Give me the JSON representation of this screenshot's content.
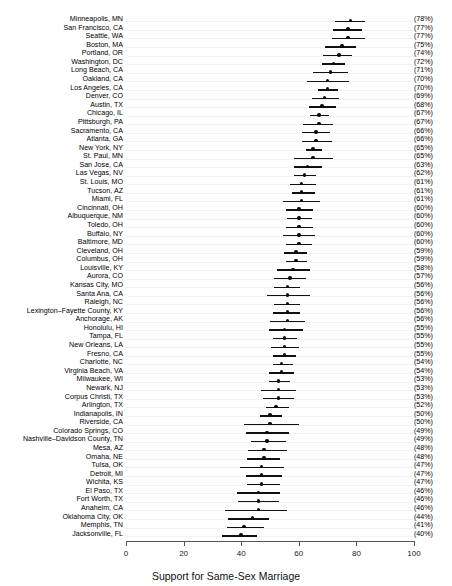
{
  "chart_data": {
    "type": "scatter",
    "title": "",
    "subtitle": "",
    "xlabel": "Support for Same-Sex Marriage",
    "ylabel": "",
    "xlim": [
      0,
      100
    ],
    "xticks": [
      0,
      20,
      40,
      60,
      80,
      100
    ],
    "xtick_labels": [
      "0",
      "20",
      "40",
      "60",
      "80",
      "100"
    ],
    "grid": true,
    "grid_orientation": "horizontal",
    "legend": null,
    "annotation_note": "Point estimate with horizontal 95% credible interval; value label in parentheses at right.",
    "point_marker": "filled-circle",
    "error_bar_style": "horizontal-line",
    "categories": [
      "Minneapolis, MN",
      "San Francisco, CA",
      "Seattle, WA",
      "Boston, MA",
      "Portland, OR",
      "Washington, DC",
      "Long Beach, CA",
      "Oakland, CA",
      "Los Angeles, CA",
      "Denver, CO",
      "Austin, TX",
      "Chicago, IL",
      "Pittsburgh, PA",
      "Sacramento, CA",
      "Atlanta, GA",
      "New York, NY",
      "St. Paul, MN",
      "San Jose, CA",
      "Las Vegas, NV",
      "St. Louis, MO",
      "Tucson, AZ",
      "Miami, FL",
      "Cincinnati, OH",
      "Albuquerque, NM",
      "Toledo, OH",
      "Buffalo, NY",
      "Baltimore, MD",
      "Cleveland, OH",
      "Columbus, OH",
      "Louisville, KY",
      "Aurora, CO",
      "Kansas City, MO",
      "Santa Ana, CA",
      "Raleigh, NC",
      "Lexington–Fayette County, KY",
      "Anchorage, AK",
      "Honolulu, HI",
      "Tampa, FL",
      "New Orleans, LA",
      "Fresno, CA",
      "Charlotte, NC",
      "Virginia Beach, VA",
      "Milwaukee, WI",
      "Newark, NJ",
      "Corpus Christi, TX",
      "Arlington, TX",
      "Indianapolis, IN",
      "Riverside, CA",
      "Colorado Springs, CO",
      "Nashville–Davidson County, TN",
      "Mesa, AZ",
      "Omaha, NE",
      "Tulsa, OK",
      "Detroit, MI",
      "Wichita, KS",
      "El Paso, TX",
      "Fort Worth, TX",
      "Anaheim, CA",
      "Oklahoma City, OK",
      "Memphis, TN",
      "Jacksonville, FL"
    ],
    "values": [
      78,
      77,
      77,
      75,
      74,
      72,
      71,
      70,
      70,
      69,
      68,
      67,
      67,
      66,
      66,
      65,
      65,
      63,
      62,
      61,
      61,
      61,
      60,
      60,
      60,
      60,
      60,
      59,
      59,
      58,
      57,
      56,
      56,
      56,
      56,
      56,
      55,
      55,
      55,
      55,
      54,
      54,
      53,
      53,
      53,
      52,
      50,
      50,
      49,
      49,
      48,
      48,
      47,
      47,
      47,
      46,
      46,
      46,
      44,
      41,
      40
    ],
    "value_labels": [
      "(78%)",
      "(77%)",
      "(77%)",
      "(75%)",
      "(74%)",
      "(72%)",
      "(71%)",
      "(70%)",
      "(70%)",
      "(69%)",
      "(68%)",
      "(67%)",
      "(67%)",
      "(66%)",
      "(66%)",
      "(65%)",
      "(65%)",
      "(63%)",
      "(62%)",
      "(61%)",
      "(61%)",
      "(61%)",
      "(60%)",
      "(60%)",
      "(60%)",
      "(60%)",
      "(60%)",
      "(59%)",
      "(59%)",
      "(58%)",
      "(57%)",
      "(56%)",
      "(56%)",
      "(56%)",
      "(56%)",
      "(56%)",
      "(55%)",
      "(55%)",
      "(55%)",
      "(55%)",
      "(54%)",
      "(54%)",
      "(53%)",
      "(53%)",
      "(53%)",
      "(52%)",
      "(50%)",
      "(50%)",
      "(49%)",
      "(49%)",
      "(48%)",
      "(48%)",
      "(47%)",
      "(47%)",
      "(47%)",
      "(46%)",
      "(46%)",
      "(46%)",
      "(44%)",
      "(41%)",
      "(40%)"
    ],
    "ci_low": [
      72.5,
      72.0,
      71.5,
      69.0,
      68.5,
      68.0,
      65.0,
      63.0,
      66.5,
      64.5,
      63.5,
      64.0,
      61.5,
      61.0,
      61.0,
      62.5,
      58.5,
      58.5,
      58.5,
      57.0,
      57.5,
      54.5,
      55.5,
      56.0,
      55.5,
      54.5,
      55.5,
      55.0,
      55.5,
      52.5,
      51.5,
      51.5,
      49.0,
      51.5,
      51.0,
      50.0,
      49.5,
      51.0,
      50.5,
      51.0,
      51.0,
      49.5,
      49.5,
      47.0,
      47.5,
      48.5,
      46.5,
      41.0,
      41.5,
      43.5,
      42.5,
      42.0,
      39.5,
      41.5,
      42.0,
      38.5,
      39.0,
      34.5,
      35.5,
      35.0,
      33.5
    ],
    "ci_high": [
      83.0,
      82.0,
      83.0,
      80.0,
      78.5,
      76.0,
      77.0,
      77.5,
      73.5,
      74.0,
      73.0,
      70.5,
      72.0,
      71.0,
      71.5,
      68.0,
      72.0,
      68.0,
      66.0,
      66.0,
      65.5,
      67.5,
      65.0,
      64.5,
      65.0,
      65.5,
      64.5,
      63.0,
      63.0,
      64.0,
      62.5,
      60.5,
      64.0,
      60.5,
      60.5,
      62.0,
      61.5,
      59.5,
      60.0,
      59.0,
      58.0,
      58.5,
      57.0,
      59.0,
      58.5,
      56.5,
      54.0,
      60.0,
      56.5,
      55.5,
      56.0,
      53.5,
      55.0,
      54.0,
      53.5,
      53.5,
      53.0,
      56.0,
      49.5,
      48.0,
      45.5
    ]
  }
}
